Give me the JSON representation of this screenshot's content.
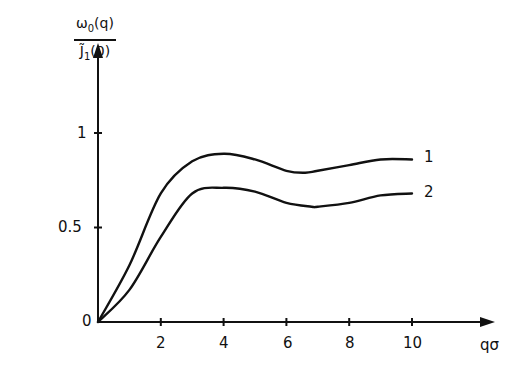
{
  "chart_data": {
    "type": "line",
    "title": "",
    "xlabel": "qσ",
    "ylabel": "ω0(q) / J̃1(0)",
    "ylabel_parts": {
      "numerator": "ω",
      "numerator_sub": "0",
      "numerator_tail": "(q)",
      "denominator": "J̃",
      "denominator_sub": "1",
      "denominator_tail": "(0)"
    },
    "xlim": [
      0,
      12.5
    ],
    "ylim": [
      0,
      1.45
    ],
    "x_ticks": [
      2,
      4,
      6,
      8,
      10
    ],
    "x_tick_labels": [
      "2",
      "4",
      "6",
      "8",
      "10"
    ],
    "y_ticks": [
      0,
      0.5,
      1
    ],
    "y_tick_labels": [
      "0",
      "0.5",
      "1"
    ],
    "grid": false,
    "legend": "curve labels at right end of each line",
    "series": [
      {
        "name": "1",
        "x": [
          0,
          1,
          2,
          3,
          4,
          5,
          6,
          6.6,
          7,
          8,
          9,
          10
        ],
        "values": [
          0,
          0.3,
          0.68,
          0.85,
          0.89,
          0.86,
          0.8,
          0.79,
          0.8,
          0.83,
          0.86,
          0.86
        ]
      },
      {
        "name": "2",
        "x": [
          0,
          1,
          2,
          3,
          4,
          5,
          6,
          6.8,
          7,
          8,
          9,
          10
        ],
        "values": [
          0,
          0.17,
          0.45,
          0.68,
          0.71,
          0.69,
          0.63,
          0.61,
          0.61,
          0.63,
          0.67,
          0.68
        ]
      }
    ]
  },
  "labels": {
    "origin": "0",
    "y_half": "0.5",
    "y_one": "1",
    "x_2": "2",
    "x_4": "4",
    "x_6": "6",
    "x_8": "8",
    "x_10": "10",
    "x_axis": "qσ",
    "curve_1": "1",
    "curve_2": "2",
    "y_num": "ω",
    "y_num_sub": "0",
    "y_num_tail": "(q)",
    "y_den": "J̃",
    "y_den_sub": "1",
    "y_den_tail": "(0)"
  }
}
